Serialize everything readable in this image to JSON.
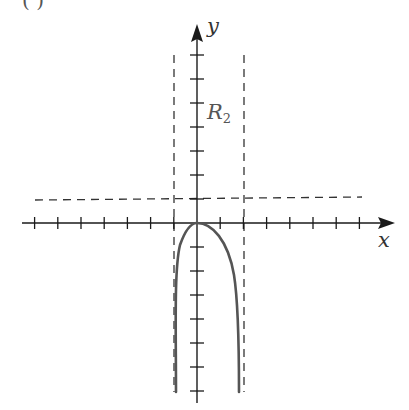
{
  "figure": {
    "part_label": "( )",
    "x_axis_label": "x",
    "y_axis_label": "y",
    "region_label": {
      "text": "R",
      "subscript": "2"
    }
  },
  "colors": {
    "axis": "#1a1a1a",
    "asymptote": "#333333",
    "curve": "#555555",
    "background": "#ffffff"
  },
  "chart_data": {
    "type": "line",
    "title": "",
    "xlabel": "x",
    "ylabel": "y",
    "x_ticks_per_unit": 1,
    "x_tick_range": [
      -7,
      7
    ],
    "y_tick_range": [
      -7,
      7
    ],
    "asymptotes": {
      "vertical": [
        -1,
        2
      ],
      "horizontal": [
        1
      ]
    },
    "annotations": [
      {
        "text": "R2",
        "x": 0.6,
        "y": 4.3
      }
    ],
    "series": [
      {
        "name": "curve",
        "description": "Single branch between vertical asymptotes x=-1 and x=2, local maximum at origin (0,0), decreasing to -infinity on both sides",
        "points": [
          [
            -0.9,
            -7
          ],
          [
            -0.85,
            -4
          ],
          [
            -0.75,
            -2.5
          ],
          [
            -0.6,
            -1.3
          ],
          [
            -0.4,
            -0.5
          ],
          [
            -0.2,
            -0.12
          ],
          [
            0,
            0
          ],
          [
            0.4,
            -0.12
          ],
          [
            0.8,
            -0.5
          ],
          [
            1.2,
            -1.3
          ],
          [
            1.5,
            -2.5
          ],
          [
            1.7,
            -4
          ],
          [
            1.8,
            -7
          ]
        ]
      }
    ]
  }
}
